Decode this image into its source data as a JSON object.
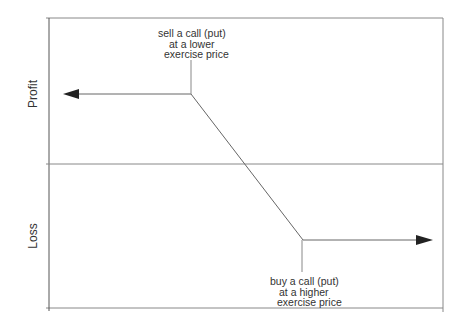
{
  "diagram": {
    "type": "payoff-diagram",
    "axis_labels": {
      "upper": "Profit",
      "lower": "Loss"
    },
    "annotations": {
      "top": {
        "lines": [
          "sell a call (put)",
          "at a lower",
          "exercise price"
        ]
      },
      "bottom": {
        "lines": [
          "buy a call (put)",
          "at a higher",
          "exercise price"
        ]
      }
    },
    "payoff_line": {
      "points": [
        [
          63,
          94
        ],
        [
          191,
          94
        ],
        [
          303,
          240
        ],
        [
          433,
          240
        ]
      ],
      "left_arrow": true,
      "right_arrow": true
    },
    "frame": {
      "left": 49,
      "top": 18,
      "right": 443,
      "bottom": 308,
      "zero_line_y": 164
    },
    "colors": {
      "line": "#555555",
      "arrow": "#222222",
      "frame": "#777777"
    }
  }
}
